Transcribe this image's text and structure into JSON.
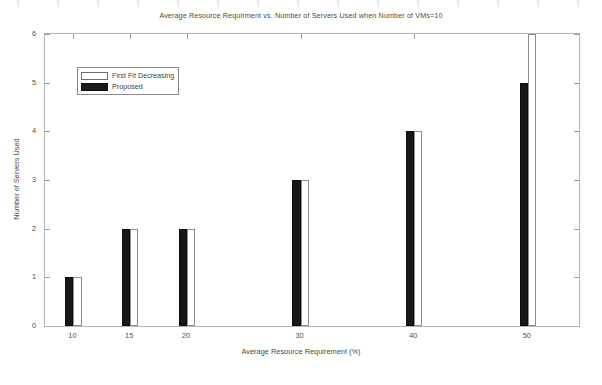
{
  "chart_data": {
    "type": "bar",
    "title": "Average Resource Requirment vs. Number of Servers Used when Number of VMs=10",
    "xlabel": "Average Resource Requirement (%)",
    "ylabel": "Number of Servers Used",
    "categories": [
      "10",
      "15",
      "20",
      "30",
      "40",
      "50"
    ],
    "category_positions": [
      10,
      15,
      20,
      30,
      40,
      50
    ],
    "xlim": [
      7.5,
      54.5
    ],
    "ylim": [
      0,
      6
    ],
    "yticks": [
      "0",
      "1",
      "2",
      "3",
      "4",
      "5",
      "6"
    ],
    "xticks": [
      "10",
      "15",
      "20",
      "30",
      "40",
      "50"
    ],
    "grid": false,
    "legend_position": "upper left",
    "series": [
      {
        "name": "Proposed",
        "color": "#171717",
        "fill": "solid-black",
        "values": [
          1,
          2,
          2,
          3,
          4,
          5
        ]
      },
      {
        "name": "First Fit Decreasing",
        "color": "#ffffff",
        "fill": "white-outline",
        "values": [
          1,
          2,
          2,
          3,
          4,
          6
        ],
        "notes": "bar at category 50 is clipped by the top of the axis"
      }
    ]
  },
  "legend": {
    "entries": [
      {
        "label": "First Fit Decreasing",
        "swatch": "white-outline-swatch"
      },
      {
        "label": "Proposed",
        "swatch": "black-filled-swatch"
      }
    ]
  },
  "axes": {
    "y_tick_labels": [
      "0",
      "1",
      "2",
      "3",
      "4",
      "5",
      "6"
    ],
    "x_tick_labels": [
      "10",
      "15",
      "20",
      "30",
      "40",
      "50"
    ]
  }
}
